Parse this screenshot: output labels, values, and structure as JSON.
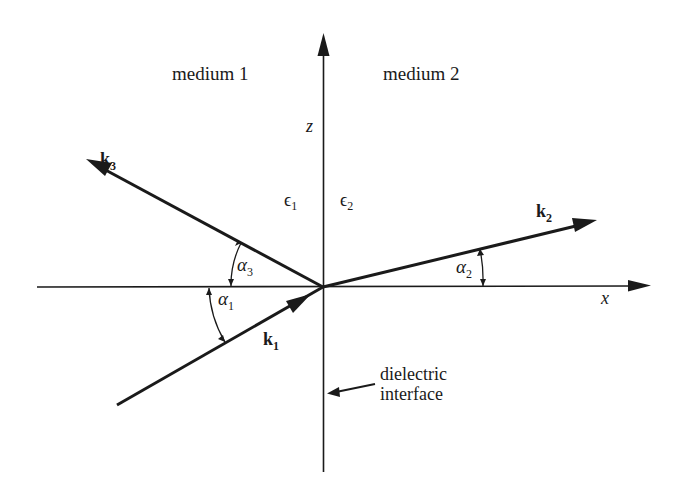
{
  "diagram": {
    "type": "reflection-refraction-at-dielectric-interface",
    "regions": {
      "left": "medium 1",
      "right": "medium 2"
    },
    "axes": {
      "vertical": "z",
      "horizontal": "x"
    },
    "permittivities": {
      "left": "ϵ",
      "left_sub": "1",
      "right": "ϵ",
      "right_sub": "2"
    },
    "vectors": [
      {
        "id": "k1",
        "name": "k",
        "sub": "1",
        "role": "incident"
      },
      {
        "id": "k2",
        "name": "k",
        "sub": "2",
        "role": "transmitted"
      },
      {
        "id": "k3",
        "name": "k",
        "sub": "3",
        "role": "reflected"
      }
    ],
    "angles": [
      {
        "id": "alpha1",
        "name": "α",
        "sub": "1"
      },
      {
        "id": "alpha2",
        "name": "α",
        "sub": "2"
      },
      {
        "id": "alpha3",
        "name": "α",
        "sub": "3"
      }
    ],
    "annotation": {
      "line1": "dielectric",
      "line2": "interface"
    },
    "colors": {
      "ink": "#1a1a1a",
      "background": "#ffffff"
    }
  }
}
